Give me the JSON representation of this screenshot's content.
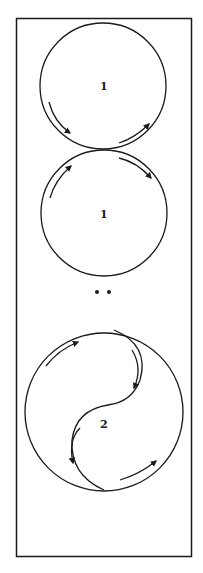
{
  "figure": {
    "frame": {
      "x": 16,
      "y": 18,
      "width": 175,
      "height": 538
    },
    "stroke_color": "#1a1a1a",
    "background_color": "#ffffff",
    "circles": [
      {
        "label": "1",
        "cx": 103,
        "cy": 86,
        "r": 63
      },
      {
        "label": "1",
        "cx": 104,
        "cy": 213,
        "r": 63
      }
    ],
    "separator": "••",
    "yin_yang": {
      "label": "2",
      "cx": 104,
      "cy": 412,
      "r": 79
    }
  }
}
